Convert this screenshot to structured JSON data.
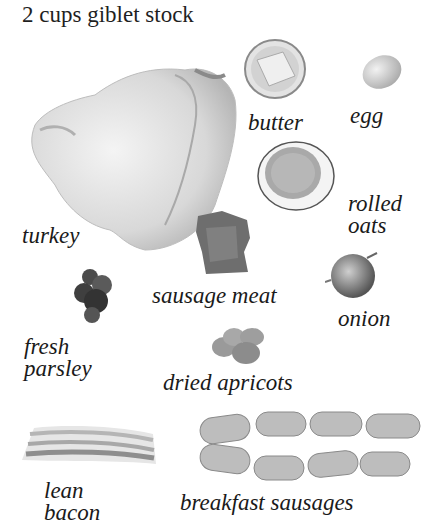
{
  "title": "2 cups giblet stock",
  "ingredients": [
    {
      "id": "turkey",
      "label": "turkey"
    },
    {
      "id": "butter",
      "label": "butter"
    },
    {
      "id": "egg",
      "label": "egg"
    },
    {
      "id": "rolled-oats",
      "label_line1": "rolled",
      "label_line2": "oats"
    },
    {
      "id": "sausage-meat",
      "label": "sausage meat"
    },
    {
      "id": "onion",
      "label": "onion"
    },
    {
      "id": "fresh-parsley",
      "label_line1": "fresh",
      "label_line2": "parsley"
    },
    {
      "id": "dried-apricots",
      "label": "dried apricots"
    },
    {
      "id": "lean-bacon",
      "label_line1": "lean",
      "label_line2": "bacon"
    },
    {
      "id": "breakfast-sausages",
      "label": "breakfast sausages"
    }
  ]
}
